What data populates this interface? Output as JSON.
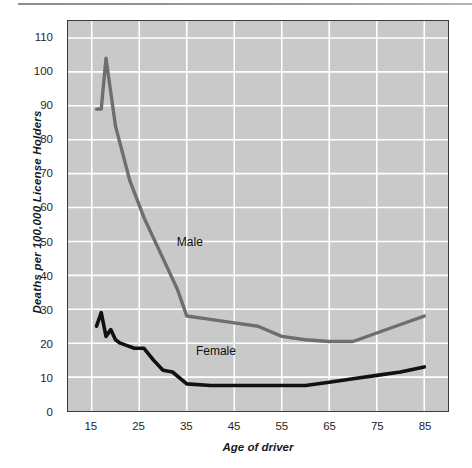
{
  "chart_data": {
    "type": "line",
    "title": "",
    "xlabel": "Age of driver",
    "ylabel": "Deaths per 100,000 License Holders",
    "xlim": [
      10,
      90
    ],
    "ylim": [
      0,
      115
    ],
    "grid": true,
    "legend_position": "inline-annotations",
    "xticks": [
      "15",
      "25",
      "35",
      "45",
      "55",
      "65",
      "75",
      "85"
    ],
    "xtick_values": [
      15,
      25,
      35,
      45,
      55,
      65,
      75,
      85
    ],
    "yticks": [
      "0",
      "10",
      "20",
      "30",
      "40",
      "50",
      "60",
      "70",
      "80",
      "90",
      "100",
      "110"
    ],
    "ytick_values": [
      0,
      10,
      20,
      30,
      40,
      50,
      60,
      70,
      80,
      90,
      100,
      110
    ],
    "series": [
      {
        "name": "Male",
        "color": "#6e6e6e",
        "label_x": 33,
        "label_y": 50,
        "x": [
          16,
          17,
          18,
          20,
          23,
          26,
          30,
          33,
          35,
          40,
          45,
          50,
          55,
          60,
          65,
          70,
          75,
          80,
          85
        ],
        "values": [
          89,
          89,
          104,
          84,
          68,
          57,
          45,
          36,
          28,
          27,
          26,
          25,
          22,
          21,
          20.5,
          20.5,
          23,
          25.5,
          28
        ]
      },
      {
        "name": "Female",
        "color": "#111111",
        "label_x": 37,
        "label_y": 18,
        "x": [
          16,
          17,
          18,
          19,
          20,
          21,
          22,
          24,
          26,
          28,
          30,
          32,
          35,
          40,
          45,
          50,
          55,
          60,
          65,
          70,
          75,
          80,
          85
        ],
        "values": [
          25,
          29,
          22,
          24,
          21,
          20,
          19.5,
          18.5,
          18.5,
          15,
          12,
          11.5,
          8,
          7.5,
          7.5,
          7.5,
          7.5,
          7.5,
          8.5,
          9.5,
          10.5,
          11.5,
          13
        ]
      }
    ]
  },
  "style": {
    "plot_background": "#c9c9c9",
    "grid_color": "#ffffff",
    "axis_color": "#3a3a3a",
    "male_color": "#6e6e6e",
    "female_color": "#111111"
  }
}
